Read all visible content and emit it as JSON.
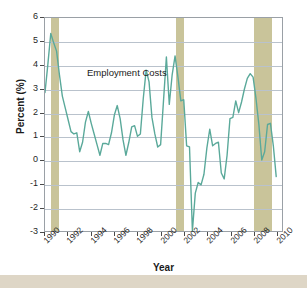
{
  "figure": {
    "top_caption": "",
    "annotation": "Employment Costs",
    "bottom_strip_color": "#ded6c6"
  },
  "chart_data": {
    "type": "line",
    "title": "",
    "xlabel": "Year",
    "ylabel": "Percent (%)",
    "xlim": [
      1990,
      2010.5
    ],
    "ylim": [
      -3,
      6
    ],
    "grid": true,
    "legend": "none",
    "line_color": "#5aa99a",
    "band_color": "#c9c49a",
    "xticks": [
      "1990",
      "1992",
      "1994",
      "1996",
      "1998",
      "2000",
      "2002",
      "2004",
      "2006",
      "2008",
      "2010"
    ],
    "xtick_values": [
      1990,
      1992,
      1994,
      1996,
      1998,
      2000,
      2002,
      2004,
      2006,
      2008,
      2010
    ],
    "yticks": [
      "6",
      "5",
      "4",
      "3",
      "2",
      "1",
      "0",
      "-1",
      "-2",
      "-3"
    ],
    "ytick_values": [
      6,
      5,
      4,
      3,
      2,
      1,
      0,
      -1,
      -2,
      -3
    ],
    "series": [
      {
        "name": "Employment Costs",
        "x": [
          1990.0,
          1990.25,
          1990.5,
          1990.75,
          1991.0,
          1991.25,
          1991.5,
          1991.75,
          1992.0,
          1992.25,
          1992.5,
          1992.75,
          1993.0,
          1993.25,
          1993.5,
          1993.75,
          1994.0,
          1994.25,
          1994.5,
          1994.75,
          1995.0,
          1995.25,
          1995.5,
          1995.75,
          1996.0,
          1996.25,
          1996.5,
          1996.75,
          1997.0,
          1997.25,
          1997.5,
          1997.75,
          1998.0,
          1998.25,
          1998.5,
          1998.75,
          1999.0,
          1999.25,
          1999.5,
          1999.75,
          2000.0,
          2000.25,
          2000.5,
          2000.75,
          2001.0,
          2001.25,
          2001.5,
          2001.75,
          2002.0,
          2002.25,
          2002.5,
          2002.75,
          2003.0,
          2003.25,
          2003.5,
          2003.75,
          2004.0,
          2004.25,
          2004.5,
          2004.75,
          2005.0,
          2005.25,
          2005.5,
          2005.75,
          2006.0,
          2006.25,
          2006.5,
          2006.75,
          2007.0,
          2007.25,
          2007.5,
          2007.75,
          2008.0,
          2008.25,
          2008.5,
          2008.75,
          2009.0,
          2009.25,
          2009.5,
          2009.75,
          2010.0
        ],
        "values": [
          2.85,
          4.05,
          5.35,
          4.95,
          4.6,
          3.6,
          2.7,
          2.2,
          1.7,
          1.2,
          1.1,
          1.15,
          0.35,
          0.75,
          1.6,
          2.05,
          1.55,
          1.1,
          0.65,
          0.2,
          0.7,
          0.7,
          0.65,
          1.15,
          1.9,
          2.3,
          1.75,
          0.85,
          0.2,
          0.75,
          1.4,
          1.45,
          1.0,
          1.1,
          2.6,
          3.8,
          3.3,
          1.8,
          1.1,
          0.55,
          0.65,
          2.5,
          4.35,
          2.35,
          3.6,
          4.4,
          3.5,
          2.5,
          2.55,
          0.6,
          0.55,
          -3.0,
          -1.4,
          -0.95,
          -1.05,
          -0.6,
          0.5,
          1.3,
          0.6,
          0.7,
          0.75,
          -0.55,
          -0.8,
          0.2,
          1.75,
          1.8,
          2.5,
          2.0,
          2.45,
          3.0,
          3.45,
          3.65,
          3.5,
          2.6,
          1.5,
          0.0,
          0.35,
          1.5,
          1.55,
          0.6,
          -0.7
        ]
      }
    ],
    "recession_bands": [
      {
        "label": "1990-91 recession",
        "start": 1990.5,
        "end": 1991.2
      },
      {
        "label": "2001 recession",
        "start": 2001.2,
        "end": 2001.9
      },
      {
        "label": "2007-09 recession",
        "start": 2007.9,
        "end": 2009.5
      }
    ]
  }
}
